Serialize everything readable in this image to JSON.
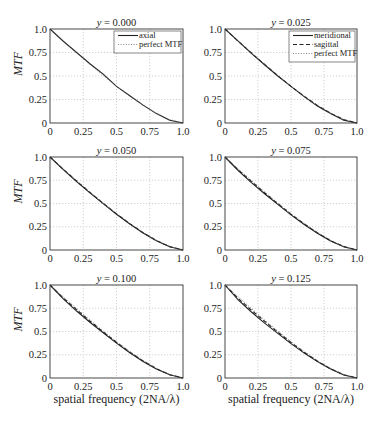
{
  "chart_data": [
    {
      "type": "line",
      "title": "y = 0.000",
      "title_var": "y",
      "title_value": "0.000",
      "ylabel": "MTF",
      "xlabel": "",
      "xlim": [
        0,
        1
      ],
      "ylim": [
        0,
        1
      ],
      "xticks": [
        "0",
        "0.25",
        "0.5",
        "0.75",
        "1.0"
      ],
      "yticks": [
        "0",
        "0.25",
        "0.5",
        "0.75",
        "1.0"
      ],
      "grid": true,
      "legend": {
        "placement": "top-right",
        "entries": [
          "axial",
          "perfect MTF"
        ]
      },
      "series": [
        {
          "name": "axial",
          "style": "solid",
          "x": [
            0,
            0.1,
            0.2,
            0.3,
            0.4,
            0.5,
            0.6,
            0.7,
            0.8,
            0.9,
            1.0
          ],
          "y": [
            1.0,
            0.87,
            0.75,
            0.63,
            0.52,
            0.39,
            0.29,
            0.19,
            0.1,
            0.03,
            0.0
          ]
        },
        {
          "name": "perfect MTF",
          "style": "dotted",
          "x": [
            0,
            0.1,
            0.2,
            0.3,
            0.4,
            0.5,
            0.6,
            0.7,
            0.8,
            0.9,
            1.0
          ],
          "y": [
            1.0,
            0.873,
            0.747,
            0.624,
            0.505,
            0.391,
            0.285,
            0.188,
            0.104,
            0.037,
            0.0
          ]
        }
      ]
    },
    {
      "type": "line",
      "title": "y = 0.025",
      "title_var": "y",
      "title_value": "0.025",
      "ylabel": "",
      "xlabel": "",
      "xlim": [
        0,
        1
      ],
      "ylim": [
        0,
        1
      ],
      "xticks": [
        "0",
        "0.25",
        "0.5",
        "0.75",
        "1.0"
      ],
      "yticks": [
        "0",
        "0.25",
        "0.5",
        "0.75",
        "1.0"
      ],
      "grid": true,
      "legend": {
        "placement": "top-right",
        "entries": [
          "meridional",
          "sagittal",
          "perfect MTF"
        ]
      },
      "series": [
        {
          "name": "meridional",
          "style": "solid",
          "x": [
            0,
            0.1,
            0.2,
            0.3,
            0.4,
            0.5,
            0.6,
            0.7,
            0.8,
            0.9,
            1.0
          ],
          "y": [
            1.0,
            0.87,
            0.74,
            0.62,
            0.5,
            0.39,
            0.28,
            0.18,
            0.1,
            0.03,
            0.0
          ]
        },
        {
          "name": "sagittal",
          "style": "dashed",
          "x": [
            0,
            0.1,
            0.2,
            0.3,
            0.4,
            0.5,
            0.6,
            0.7,
            0.8,
            0.9,
            1.0
          ],
          "y": [
            1.0,
            0.87,
            0.745,
            0.622,
            0.503,
            0.39,
            0.284,
            0.187,
            0.103,
            0.036,
            0.0
          ]
        },
        {
          "name": "perfect MTF",
          "style": "dotted",
          "x": [
            0,
            0.1,
            0.2,
            0.3,
            0.4,
            0.5,
            0.6,
            0.7,
            0.8,
            0.9,
            1.0
          ],
          "y": [
            1.0,
            0.873,
            0.747,
            0.624,
            0.505,
            0.391,
            0.285,
            0.188,
            0.104,
            0.037,
            0.0
          ]
        }
      ]
    },
    {
      "type": "line",
      "title": "y = 0.050",
      "title_var": "y",
      "title_value": "0.050",
      "ylabel": "MTF",
      "xlabel": "",
      "xlim": [
        0,
        1
      ],
      "ylim": [
        0,
        1
      ],
      "xticks": [
        "0",
        "0.25",
        "0.5",
        "0.75",
        "1.0"
      ],
      "yticks": [
        "0",
        "0.25",
        "0.5",
        "0.75",
        "1.0"
      ],
      "grid": true,
      "series": [
        {
          "name": "meridional",
          "style": "solid",
          "x": [
            0,
            0.1,
            0.2,
            0.3,
            0.4,
            0.5,
            0.6,
            0.7,
            0.8,
            0.9,
            1.0
          ],
          "y": [
            1.0,
            0.865,
            0.735,
            0.615,
            0.498,
            0.385,
            0.28,
            0.183,
            0.1,
            0.035,
            0.0
          ]
        },
        {
          "name": "sagittal",
          "style": "dashed",
          "x": [
            0,
            0.1,
            0.2,
            0.3,
            0.4,
            0.5,
            0.6,
            0.7,
            0.8,
            0.9,
            1.0
          ],
          "y": [
            1.0,
            0.868,
            0.742,
            0.62,
            0.502,
            0.389,
            0.283,
            0.186,
            0.102,
            0.036,
            0.0
          ]
        },
        {
          "name": "perfect MTF",
          "style": "dotted",
          "x": [
            0,
            0.1,
            0.2,
            0.3,
            0.4,
            0.5,
            0.6,
            0.7,
            0.8,
            0.9,
            1.0
          ],
          "y": [
            1.0,
            0.873,
            0.747,
            0.624,
            0.505,
            0.391,
            0.285,
            0.188,
            0.104,
            0.037,
            0.0
          ]
        }
      ]
    },
    {
      "type": "line",
      "title": "y = 0.075",
      "title_var": "y",
      "title_value": "0.075",
      "ylabel": "",
      "xlabel": "",
      "xlim": [
        0,
        1
      ],
      "ylim": [
        0,
        1
      ],
      "xticks": [
        "0",
        "0.25",
        "0.5",
        "0.75",
        "1.0"
      ],
      "yticks": [
        "0",
        "0.25",
        "0.5",
        "0.75",
        "1.0"
      ],
      "grid": true,
      "series": [
        {
          "name": "meridional",
          "style": "solid",
          "x": [
            0,
            0.1,
            0.2,
            0.3,
            0.4,
            0.5,
            0.6,
            0.7,
            0.8,
            0.9,
            1.0
          ],
          "y": [
            1.0,
            0.855,
            0.725,
            0.605,
            0.49,
            0.378,
            0.275,
            0.18,
            0.098,
            0.034,
            0.0
          ]
        },
        {
          "name": "sagittal",
          "style": "dashed",
          "x": [
            0,
            0.1,
            0.2,
            0.3,
            0.4,
            0.5,
            0.6,
            0.7,
            0.8,
            0.9,
            1.0
          ],
          "y": [
            1.0,
            0.862,
            0.738,
            0.616,
            0.498,
            0.386,
            0.281,
            0.185,
            0.101,
            0.036,
            0.0
          ]
        },
        {
          "name": "perfect MTF",
          "style": "dotted",
          "x": [
            0,
            0.1,
            0.2,
            0.3,
            0.4,
            0.5,
            0.6,
            0.7,
            0.8,
            0.9,
            1.0
          ],
          "y": [
            1.0,
            0.873,
            0.747,
            0.624,
            0.505,
            0.391,
            0.285,
            0.188,
            0.104,
            0.037,
            0.0
          ]
        }
      ]
    },
    {
      "type": "line",
      "title": "y = 0.100",
      "title_var": "y",
      "title_value": "0.100",
      "ylabel": "MTF",
      "xlabel": "spatial frequency  (2NA/λ)",
      "xlim": [
        0,
        1
      ],
      "ylim": [
        0,
        1
      ],
      "xticks": [
        "0",
        "0.25",
        "0.5",
        "0.75",
        "1.0"
      ],
      "yticks": [
        "0",
        "0.25",
        "0.5",
        "0.75",
        "1.0"
      ],
      "grid": true,
      "series": [
        {
          "name": "meridional",
          "style": "solid",
          "x": [
            0,
            0.1,
            0.2,
            0.3,
            0.4,
            0.5,
            0.6,
            0.7,
            0.8,
            0.9,
            1.0
          ],
          "y": [
            1.0,
            0.85,
            0.72,
            0.6,
            0.487,
            0.375,
            0.272,
            0.178,
            0.097,
            0.034,
            0.0
          ]
        },
        {
          "name": "sagittal",
          "style": "dashed",
          "x": [
            0,
            0.1,
            0.2,
            0.3,
            0.4,
            0.5,
            0.6,
            0.7,
            0.8,
            0.9,
            1.0
          ],
          "y": [
            1.0,
            0.86,
            0.735,
            0.613,
            0.496,
            0.384,
            0.279,
            0.183,
            0.1,
            0.035,
            0.0
          ]
        },
        {
          "name": "perfect MTF",
          "style": "dotted",
          "x": [
            0,
            0.1,
            0.2,
            0.3,
            0.4,
            0.5,
            0.6,
            0.7,
            0.8,
            0.9,
            1.0
          ],
          "y": [
            1.0,
            0.873,
            0.747,
            0.624,
            0.505,
            0.391,
            0.285,
            0.188,
            0.104,
            0.037,
            0.0
          ]
        }
      ]
    },
    {
      "type": "line",
      "title": "y = 0.125",
      "title_var": "y",
      "title_value": "0.125",
      "ylabel": "",
      "xlabel": "spatial frequency  (2NA/λ)",
      "xlim": [
        0,
        1
      ],
      "ylim": [
        0,
        1
      ],
      "xticks": [
        "0",
        "0.25",
        "0.5",
        "0.75",
        "1.0"
      ],
      "yticks": [
        "0",
        "0.25",
        "0.5",
        "0.75",
        "1.0"
      ],
      "grid": true,
      "series": [
        {
          "name": "meridional",
          "style": "solid",
          "x": [
            0,
            0.1,
            0.2,
            0.3,
            0.4,
            0.5,
            0.6,
            0.7,
            0.8,
            0.9,
            1.0
          ],
          "y": [
            1.0,
            0.84,
            0.71,
            0.59,
            0.48,
            0.37,
            0.268,
            0.176,
            0.096,
            0.033,
            0.0
          ]
        },
        {
          "name": "sagittal",
          "style": "dashed",
          "x": [
            0,
            0.1,
            0.2,
            0.3,
            0.4,
            0.5,
            0.6,
            0.7,
            0.8,
            0.9,
            1.0
          ],
          "y": [
            1.0,
            0.855,
            0.73,
            0.61,
            0.494,
            0.382,
            0.277,
            0.182,
            0.099,
            0.035,
            0.0
          ]
        },
        {
          "name": "perfect MTF",
          "style": "dotted",
          "x": [
            0,
            0.1,
            0.2,
            0.3,
            0.4,
            0.5,
            0.6,
            0.7,
            0.8,
            0.9,
            1.0
          ],
          "y": [
            1.0,
            0.873,
            0.747,
            0.624,
            0.505,
            0.391,
            0.285,
            0.188,
            0.104,
            0.037,
            0.0
          ]
        }
      ]
    }
  ],
  "colors": {
    "line": "#222222",
    "grid": "#bdbdbd",
    "frame": "#333333"
  }
}
